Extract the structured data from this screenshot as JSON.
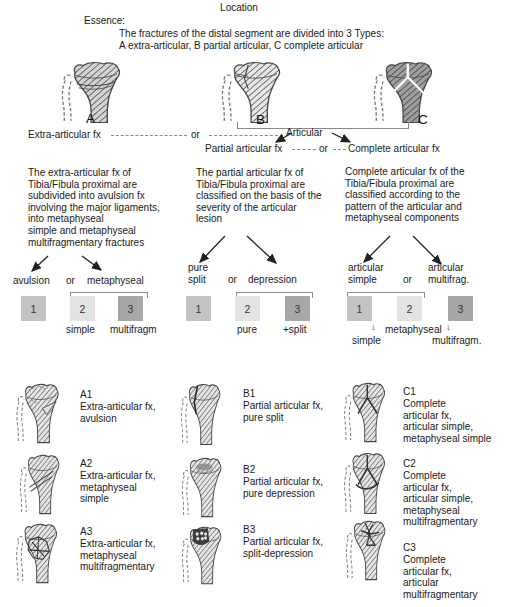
{
  "title": {
    "location": "Location",
    "essence": "Essence:",
    "essence_text": "The fractures of the distal segment are divided into 3 Types:\nA extra-articular, B partial articular, C complete articular"
  },
  "top": {
    "letters": [
      "A",
      "B",
      "C"
    ],
    "extra_articular": "Extra-articular fx",
    "or_top": "or",
    "articular": "Articular",
    "partial": "Partial articular fx",
    "or_mid": "or",
    "complete": "Complete articular fx"
  },
  "columns": {
    "a": {
      "paragraph": "The extra-articular fx of\nTibia/Fibula proximal are\nsubdivided into avulsion fx\ninvolving the major ligaments,\ninto metaphyseal\nsimple and metaphyseal\nmultifragmentary fractures",
      "branch_left": "avulsion",
      "branch_or": "or",
      "branch_right": "metaphyseal",
      "squares": [
        "1",
        "2",
        "3"
      ],
      "sub_left": "simple",
      "sub_right": "multifragm"
    },
    "b": {
      "paragraph": "The partial articular fx of\nTibia/Fibula proximal are\nclassified on the basis of the\nseverity of the articular\nlesion",
      "branch_left": "pure\nsplit",
      "branch_or": "or",
      "branch_right": "depression",
      "squares": [
        "1",
        "2",
        "3"
      ],
      "sub_left": "pure",
      "sub_right": "+split"
    },
    "c": {
      "paragraph": "Complete articular fx of the\nTibia/Fibula proximal are\nclassified according to the\npattern of the articular and\nmetaphyseal components",
      "branch_left": "articular\nsimple",
      "branch_or": "or",
      "branch_right": "articular\nmultifrag.",
      "squares": [
        "1",
        "2",
        "3"
      ],
      "arrow_down": "↓",
      "mid_label": "metaphyseal",
      "sub_left": "simple",
      "sub_right": "multifragm."
    }
  },
  "types": [
    {
      "code": "A1",
      "label": "Extra-articular fx,\navulsion"
    },
    {
      "code": "A2",
      "label": "Extra-articular fx,\nmetaphyseal\nsimple"
    },
    {
      "code": "A3",
      "label": "Extra-articular fx,\nmetaphyseal\nmultifragmentary"
    },
    {
      "code": "B1",
      "label": "Partial articular fx,\npure split"
    },
    {
      "code": "B2",
      "label": "Partial articular fx,\npure depression"
    },
    {
      "code": "B3",
      "label": "Partial articular fx,\nsplit-depression"
    },
    {
      "code": "C1",
      "label": "Complete\narticular fx,\narticular simple,\nmetaphyseal simple"
    },
    {
      "code": "C2",
      "label": "Complete\narticular fx,\narticular simple,\nmetaphyseal\nmultifragmentary"
    },
    {
      "code": "C3",
      "label": "Complete\narticular fx,\narticular\nmultifragmentary"
    }
  ],
  "colors": {
    "square_1": "#c3c3c3",
    "square_2": "#e3e3e3",
    "square_3": "#a7a7a7",
    "bone_a": "#d4d4d4",
    "bone_b": "#e7e7e7",
    "bone_c": "#9f9f9f",
    "bone_small": "#e6e6e6",
    "text": "#1a1a1a"
  }
}
